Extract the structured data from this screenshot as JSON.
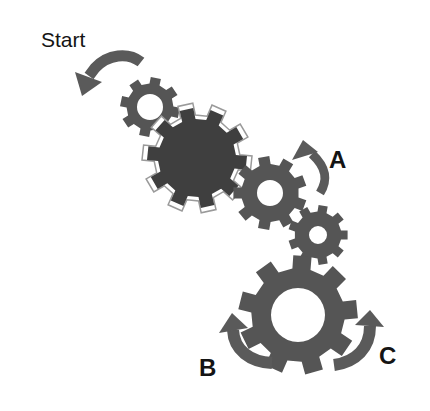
{
  "diagram": {
    "labels": {
      "start": "Start",
      "a": "A",
      "b": "B",
      "c": "C"
    },
    "colors": {
      "gear": "#555555",
      "drive_gear": "#3f3f3f",
      "arrow": "#5a5a5a",
      "text": "#141414",
      "background": "#ffffff"
    },
    "gears": [
      {
        "id": "gear-1",
        "cx": 150,
        "cy": 107,
        "outer_r": 30,
        "hole_r": 13,
        "teeth": 8
      },
      {
        "id": "drive-gear",
        "cx": 197,
        "cy": 158,
        "outer_r": 50,
        "hole_r": 0,
        "teeth": 10,
        "outlined": true
      },
      {
        "id": "gear-2",
        "cx": 270,
        "cy": 193,
        "outer_r": 37,
        "hole_r": 13,
        "teeth": 9
      },
      {
        "id": "gear-3",
        "cx": 318,
        "cy": 235,
        "outer_r": 30,
        "hole_r": 9,
        "teeth": 9
      },
      {
        "id": "ring-gear",
        "cx": 298,
        "cy": 315,
        "outer_r": 60,
        "hole_r": 27,
        "teeth": 9
      }
    ],
    "arrows": [
      {
        "id": "start-arrow",
        "direction": "counter-clockwise"
      },
      {
        "id": "a-arrow",
        "direction": "upward"
      },
      {
        "id": "b-arrow",
        "direction": "upward-left"
      },
      {
        "id": "c-arrow",
        "direction": "upward-right"
      }
    ]
  }
}
